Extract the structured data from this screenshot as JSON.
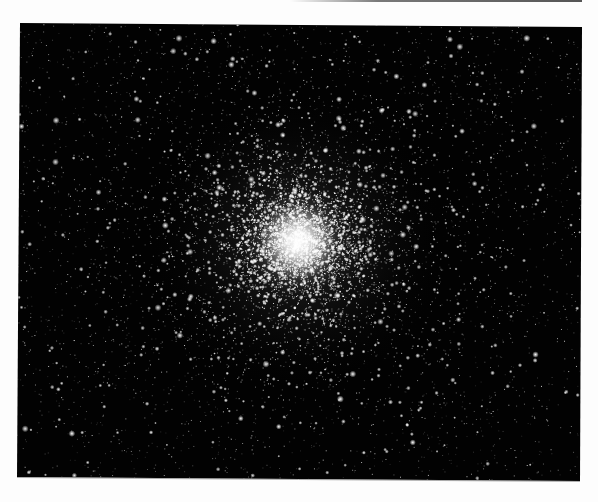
{
  "image": {
    "subject": "globular star cluster",
    "description": "Photograph of a dense globular star cluster on a black sky background, scanned slightly skewed on a white page",
    "background_color": "#fdfdfd",
    "sky_color": "#020202",
    "star_color": "#ffffff",
    "frame": {
      "top_left": [
        20,
        23
      ],
      "top_right": [
        582,
        27
      ],
      "bottom_right": [
        580,
        481
      ],
      "bottom_left": [
        17,
        477
      ]
    },
    "cluster_core": {
      "center": [
        298,
        242
      ],
      "core_radius": 38,
      "halo_radius": 150
    },
    "star_field": {
      "seed": 1337,
      "field_star_count": 3200,
      "cluster_star_count": 5200,
      "bright_star_count": 140
    }
  }
}
